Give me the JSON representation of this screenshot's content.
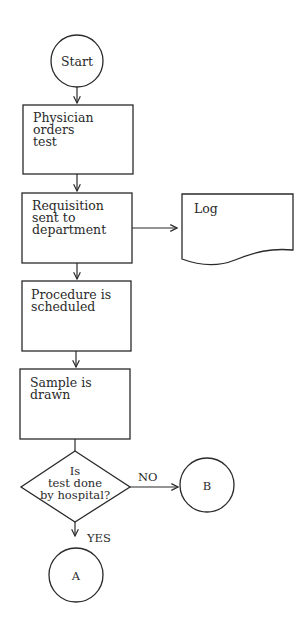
{
  "diagram": {
    "type": "flowchart",
    "nodes": {
      "start": {
        "shape": "circle",
        "label": "Start"
      },
      "physician": {
        "shape": "process",
        "lines": [
          "Physician",
          "orders",
          "test"
        ]
      },
      "requisition": {
        "shape": "process",
        "lines": [
          "Requisition",
          "sent to",
          "department"
        ]
      },
      "log": {
        "shape": "document",
        "label": "Log"
      },
      "procedure": {
        "shape": "process",
        "lines": [
          "Procedure is",
          "scheduled"
        ]
      },
      "sample": {
        "shape": "process",
        "lines": [
          "Sample is",
          "drawn"
        ]
      },
      "decision": {
        "shape": "diamond",
        "lines": [
          "Is",
          "test done",
          "by hospital?"
        ]
      },
      "connector_b": {
        "shape": "circle",
        "label": "B"
      },
      "connector_a": {
        "shape": "circle",
        "label": "A"
      }
    },
    "edges": {
      "no_label": "NO",
      "yes_label": "YES"
    },
    "edge_list": [
      {
        "from": "start",
        "to": "physician"
      },
      {
        "from": "physician",
        "to": "requisition"
      },
      {
        "from": "requisition",
        "to": "log"
      },
      {
        "from": "requisition",
        "to": "procedure"
      },
      {
        "from": "procedure",
        "to": "sample"
      },
      {
        "from": "sample",
        "to": "decision"
      },
      {
        "from": "decision",
        "to": "connector_b",
        "label": "NO"
      },
      {
        "from": "decision",
        "to": "connector_a",
        "label": "YES"
      }
    ]
  }
}
